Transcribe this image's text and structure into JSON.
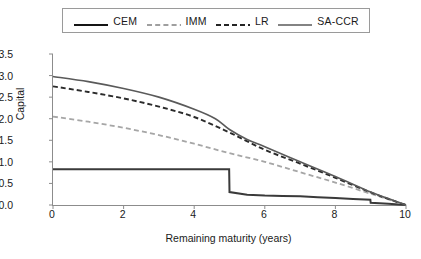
{
  "chart_data": {
    "type": "line",
    "title": "",
    "xlabel": "Remaining maturity (years)",
    "ylabel": "Capital",
    "xlim": [
      0,
      10
    ],
    "ylim": [
      0,
      3.5
    ],
    "xticks": [
      "0",
      "2",
      "4",
      "6",
      "8",
      "10"
    ],
    "xtick_values": [
      0,
      2,
      4,
      6,
      8,
      10
    ],
    "yticks": [
      "0.0",
      "0.5",
      "1.0",
      "1.5",
      "2.0",
      "2.5",
      "3.0",
      "3.5"
    ],
    "ytick_values": [
      0.0,
      0.5,
      1.0,
      1.5,
      2.0,
      2.5,
      3.0,
      3.5
    ],
    "grid": false,
    "legend_position": "top",
    "series": [
      {
        "name": "CEM",
        "style": "solid",
        "color": "#3a3a3a",
        "width": 2.0,
        "x": [
          0,
          1,
          2,
          3,
          4,
          4.99,
          5.0,
          5.5,
          6,
          6.5,
          7,
          7.5,
          8,
          8.5,
          8.99,
          9.0,
          9.5,
          10
        ],
        "values": [
          0.83,
          0.83,
          0.83,
          0.83,
          0.83,
          0.83,
          0.3,
          0.24,
          0.22,
          0.21,
          0.2,
          0.18,
          0.16,
          0.14,
          0.12,
          0.05,
          0.03,
          0.0
        ]
      },
      {
        "name": "IMM",
        "style": "dashed",
        "color": "#a6a6a6",
        "width": 1.8,
        "x": [
          0,
          1,
          2,
          3,
          4,
          5,
          6,
          7,
          8,
          9,
          9.5,
          10
        ],
        "values": [
          2.05,
          1.93,
          1.79,
          1.62,
          1.42,
          1.2,
          1.0,
          0.76,
          0.52,
          0.26,
          0.13,
          0.0
        ]
      },
      {
        "name": "LR",
        "style": "dashed",
        "color": "#2b2b2b",
        "width": 1.9,
        "x": [
          0,
          1,
          2,
          3,
          4,
          5,
          6,
          7,
          8,
          9,
          9.5,
          10
        ],
        "values": [
          2.75,
          2.62,
          2.47,
          2.28,
          2.04,
          1.68,
          1.28,
          0.96,
          0.63,
          0.29,
          0.14,
          0.0
        ]
      },
      {
        "name": "SA-CCR",
        "style": "solid",
        "color": "#5a5a5a",
        "width": 1.6,
        "x": [
          0,
          1,
          2,
          3,
          4,
          4.6,
          5,
          5.5,
          6,
          7,
          8,
          9,
          9.5,
          10
        ],
        "values": [
          2.98,
          2.86,
          2.7,
          2.5,
          2.22,
          2.0,
          1.75,
          1.52,
          1.35,
          1.0,
          0.66,
          0.3,
          0.15,
          0.0
        ]
      }
    ]
  },
  "legend": {
    "items": [
      {
        "label": "CEM"
      },
      {
        "label": "IMM"
      },
      {
        "label": "LR"
      },
      {
        "label": "SA-CCR"
      }
    ]
  }
}
